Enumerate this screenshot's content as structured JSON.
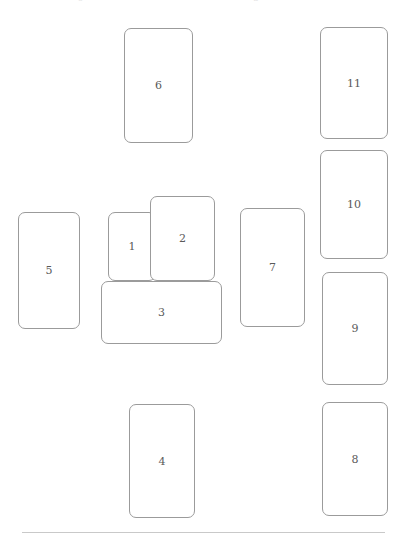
{
  "page": {
    "width": 406,
    "height": 539,
    "background_color": "#ffffff",
    "card_border_color": "#9b9b9b",
    "card_fill_color": "#ffffff",
    "label_color": "#5a5a5a",
    "rule_color": "#c9c9c9"
  },
  "top_clipped_text": {
    "fragment_left": "o",
    "fragment_right": "u"
  },
  "cards": [
    {
      "label": "6",
      "x": 124,
      "y": 28,
      "w": 69,
      "h": 115,
      "orientation": "portrait",
      "z": 1
    },
    {
      "label": "11",
      "x": 320,
      "y": 27,
      "w": 68,
      "h": 112,
      "orientation": "portrait",
      "z": 1
    },
    {
      "label": "10",
      "x": 320,
      "y": 150,
      "w": 68,
      "h": 109,
      "orientation": "portrait",
      "z": 1
    },
    {
      "label": "2",
      "x": 150,
      "y": 196,
      "w": 65,
      "h": 85,
      "orientation": "portrait",
      "z": 3
    },
    {
      "label": "7",
      "x": 240,
      "y": 208,
      "w": 65,
      "h": 119,
      "orientation": "portrait",
      "z": 1
    },
    {
      "label": "1",
      "x": 108,
      "y": 212,
      "w": 48,
      "h": 69,
      "orientation": "portrait",
      "z": 2
    },
    {
      "label": "5",
      "x": 18,
      "y": 212,
      "w": 62,
      "h": 117,
      "orientation": "portrait",
      "z": 1
    },
    {
      "label": "9",
      "x": 322,
      "y": 272,
      "w": 66,
      "h": 113,
      "orientation": "portrait",
      "z": 1
    },
    {
      "label": "3",
      "x": 101,
      "y": 281,
      "w": 121,
      "h": 63,
      "orientation": "landscape",
      "z": 4
    },
    {
      "label": "8",
      "x": 322,
      "y": 402,
      "w": 66,
      "h": 114,
      "orientation": "portrait",
      "z": 1
    },
    {
      "label": "4",
      "x": 129,
      "y": 404,
      "w": 66,
      "h": 114,
      "orientation": "portrait",
      "z": 1
    }
  ],
  "bottom_rule": {
    "x": 22,
    "y": 532,
    "w": 363,
    "h": 1
  }
}
